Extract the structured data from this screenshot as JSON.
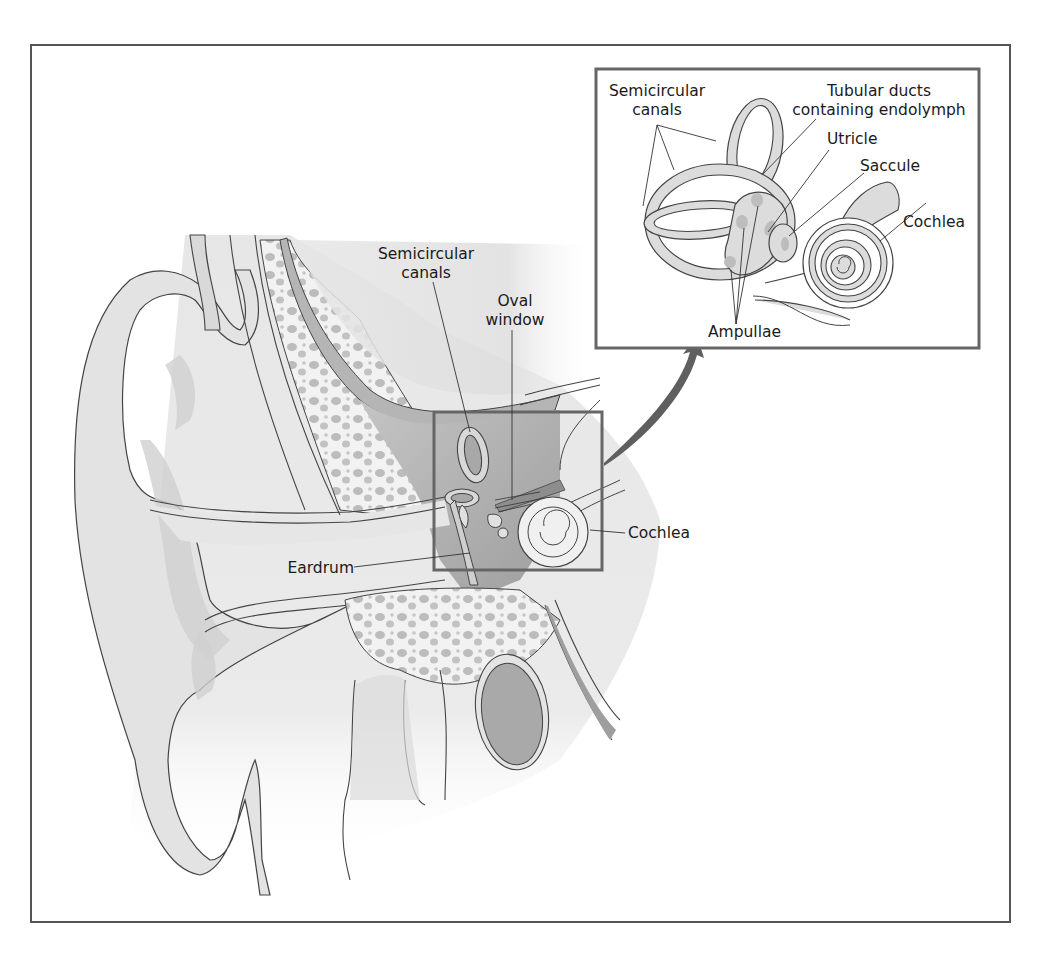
{
  "figure": {
    "colors": {
      "frame": "#555555",
      "box_outline": "#6b6b6b",
      "arrow": "#5f5f5f",
      "skin_light": "#ececec",
      "skin_mid": "#d9d9d9",
      "tissue_dark": "#a8a8a8",
      "bone_spots": "#bdbdbd",
      "line": "#3a3a3a"
    },
    "main_labels": {
      "semicircular_canals_line1": "Semicircular",
      "semicircular_canals_line2": "canals",
      "oval_window_line1": "Oval",
      "oval_window_line2": "window",
      "cochlea": "Cochlea",
      "eardrum": "Eardrum"
    },
    "inset_labels": {
      "semicircular_canals_line1": "Semicircular",
      "semicircular_canals_line2": "canals",
      "tubular_ducts_line1": "Tubular ducts",
      "tubular_ducts_line2": "containing endolymph",
      "utricle": "Utricle",
      "saccule": "Saccule",
      "cochlea": "Cochlea",
      "ampullae": "Ampullae"
    }
  }
}
